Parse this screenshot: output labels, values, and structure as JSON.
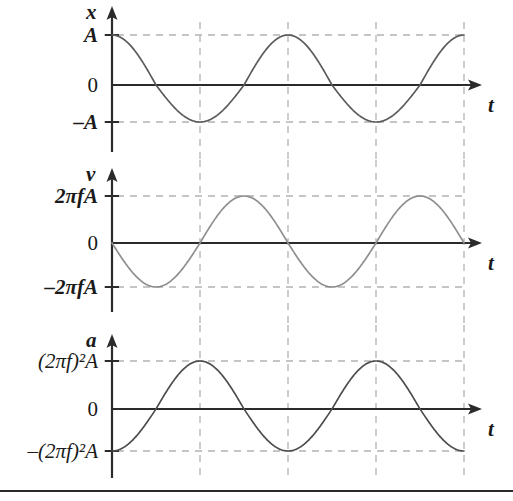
{
  "figure": {
    "width": 513,
    "height": 501,
    "background": "#ffffff",
    "axis_color": "#2b2b2b",
    "grid_color": "#b3b3b3",
    "rule_color": "#2b2b2b"
  },
  "panels": [
    {
      "id": "displacement",
      "axis_label": "x",
      "time_label": "t",
      "curve_color": "#5c5c5c",
      "labels": {
        "max": "A",
        "zero": "0",
        "min": "–A"
      }
    },
    {
      "id": "velocity",
      "axis_label": "v",
      "time_label": "t",
      "curve_color": "#8f8f8f",
      "labels": {
        "max_prefix": "2",
        "max_pi": "π",
        "max_f": "f",
        "max_A": "A",
        "zero": "0",
        "min_sign": "–",
        "max": "2πfA",
        "min": "–2πfA"
      }
    },
    {
      "id": "acceleration",
      "axis_label": "a",
      "time_label": "t",
      "curve_color": "#4d4d4d",
      "labels": {
        "zero": "0",
        "max": "(2πf)²A",
        "min": "–(2πf)²A"
      }
    }
  ],
  "chart_data": {
    "type": "line",
    "xlabel": "t",
    "grid": true,
    "legend_position": "none",
    "x_gridlines_px": [
      200,
      288,
      376,
      464
    ],
    "x_axis_start_px": 112,
    "x_axis_end_px": 482,
    "period_px": 176,
    "subplots": [
      {
        "id": "displacement",
        "ylabel": "x",
        "equation": "x = A cos(2πft)",
        "ytick_labels": [
          "A",
          "0",
          "–A"
        ],
        "ytick_values": [
          1,
          0,
          -1
        ],
        "ytick_px": [
          35,
          85,
          122
        ],
        "ylim": [
          -1,
          1
        ],
        "phase": "cosine",
        "start_value": 1,
        "amplitude_label": "A"
      },
      {
        "id": "velocity",
        "ylabel": "v",
        "equation": "v = –2πfA sin(2πft)",
        "ytick_labels": [
          "2πfA",
          "0",
          "–2πfA"
        ],
        "ytick_values": [
          1,
          0,
          -1
        ],
        "ytick_px": [
          196,
          243,
          287
        ],
        "ylim": [
          -1,
          1
        ],
        "phase": "negative-sine",
        "start_value": 0,
        "amplitude_label": "2πfA"
      },
      {
        "id": "acceleration",
        "ylabel": "a",
        "equation": "a = –(2πf)²A cos(2πft)",
        "ytick_labels": [
          "(2πf)²A",
          "0",
          "–(2πf)²A"
        ],
        "ytick_values": [
          1,
          0,
          -1
        ],
        "ytick_px": [
          361,
          409,
          451
        ],
        "ylim": [
          -1,
          1
        ],
        "phase": "negative-cosine",
        "start_value": -1,
        "amplitude_label": "(2πf)²A"
      }
    ]
  }
}
